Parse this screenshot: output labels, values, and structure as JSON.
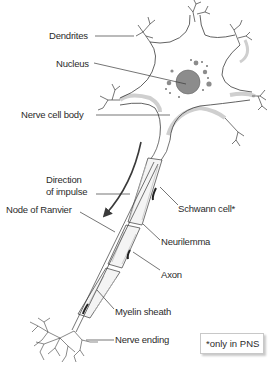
{
  "diagram": {
    "labels": {
      "dendrites": "Dendrites",
      "nucleus": "Nucleus",
      "nerve_cell_body": "Nerve cell body",
      "direction_line1": "Direction",
      "direction_line2": "of impulse",
      "node_of_ranvier": "Node of Ranvier",
      "schwann_cell": "Schwann cell*",
      "neurilemma": "Neurilemma",
      "axon": "Axon",
      "myelin_sheath": "Myelin sheath",
      "nerve_ending": "Nerve ending"
    },
    "footnote": "*only in PNS",
    "colors": {
      "outline": "#3a3a3a",
      "nucleus_fill": "#8c8c8c",
      "sheath_shade": "#cfcfcf",
      "label_text": "#2b2b2b",
      "leader_line": "#3a3a3a"
    }
  }
}
